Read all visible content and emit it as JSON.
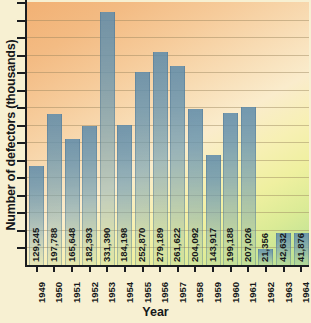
{
  "chart_data": {
    "type": "bar",
    "title": "",
    "xlabel": "Year",
    "ylabel": "Number of defectors (thousands)",
    "categories": [
      "1949",
      "1950",
      "1951",
      "1952",
      "1953",
      "1954",
      "1955",
      "1956",
      "1957",
      "1958",
      "1959",
      "1960",
      "1961",
      "1962",
      "1963",
      "1964"
    ],
    "values": [
      129245,
      197788,
      165648,
      182393,
      331390,
      184198,
      252870,
      279189,
      261622,
      204092,
      143917,
      199188,
      207026,
      21356,
      42632,
      41876
    ],
    "value_labels": [
      "129,245",
      "197,788",
      "165,648",
      "182,393",
      "331,390",
      "184,198",
      "252,870",
      "279,189",
      "261,622",
      "204,092",
      "143,917",
      "199,188",
      "207,026",
      "21,356",
      "42,632",
      "41,876"
    ],
    "ylim": [
      0,
      345000
    ],
    "grid": true,
    "gridline_count": 14,
    "ytick_count": 15,
    "ytick_labels": [],
    "legend": "none",
    "series": [
      {
        "name": "Number of defectors",
        "values": [
          129245,
          197788,
          165648,
          182393,
          331390,
          184198,
          252870,
          279189,
          261622,
          204092,
          143917,
          199188,
          207026,
          21356,
          42632,
          41876
        ]
      }
    ],
    "colors": {
      "bar": "#6a93b2",
      "background_top": "#f2b174",
      "background_bottom": "#b7df96",
      "axis": "#1b1d20",
      "gridline": "#96825a",
      "text": "#16181a",
      "page": "#f7f0d2"
    }
  }
}
